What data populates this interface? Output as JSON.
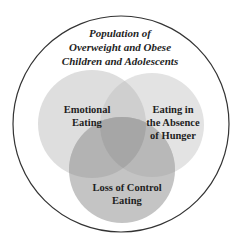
{
  "diagram": {
    "type": "venn",
    "title_lines": [
      "Population of",
      "Overweight and Obese",
      "Children and Adolescents"
    ],
    "sets": [
      {
        "id": "emotional",
        "label_lines": [
          "Emotional",
          "Eating"
        ]
      },
      {
        "id": "absence",
        "label_lines": [
          "Eating in",
          "the Absence",
          "of Hunger"
        ]
      },
      {
        "id": "loss_of_control",
        "label_lines": [
          "Loss of Control",
          "Eating"
        ]
      }
    ],
    "colors": {
      "outline": "#333333",
      "set_fill": "#d9d9d9",
      "pair_overlap": "#bdbdbd",
      "triple_overlap": "#a3a3a3"
    }
  }
}
